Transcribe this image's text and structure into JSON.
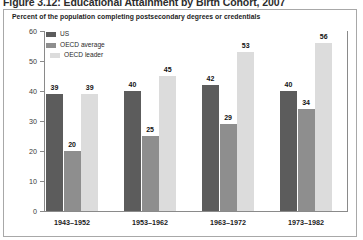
{
  "figure": {
    "title": "Figure 3.12: Educational Attainment by Birth Cohort, 2007",
    "subtitle": "Percent of the population completing postsecondary degrees or credentials"
  },
  "chart_data": {
    "type": "bar",
    "title": "Educational Attainment by Birth Cohort, 2007",
    "subtitle": "Percent of the population completing postsecondary degrees or credentials",
    "xlabel": "",
    "ylabel": "",
    "ylim": [
      0,
      60
    ],
    "yticks": [
      0,
      10,
      20,
      30,
      40,
      50,
      60
    ],
    "grid": false,
    "data_labels": true,
    "legend_position": "inside top-left",
    "categories": [
      "1943–1952",
      "1953–1962",
      "1963–1972",
      "1973–1982"
    ],
    "series": [
      {
        "name": "US",
        "color": "#5c5c5c",
        "values": [
          39,
          40,
          42,
          40
        ]
      },
      {
        "name": "OECD average",
        "color": "#8e8e8e",
        "values": [
          20,
          25,
          29,
          34
        ]
      },
      {
        "name": "OECD leader",
        "color": "#dcdcdc",
        "values": [
          39,
          45,
          53,
          56
        ]
      }
    ]
  }
}
